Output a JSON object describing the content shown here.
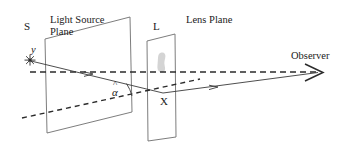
{
  "figure": {
    "background_color": "#ffffff",
    "line_color": "#3a3a3a",
    "blob_color": "#cccccc",
    "labels": {
      "source_plane_marker": "S",
      "source_plane_name_line1": "Light Source",
      "source_plane_name_line2": "Plane",
      "lens_plane_marker": "L",
      "lens_plane_name": "Lens Plane",
      "source_height": "y",
      "lens_point": "X",
      "observer": "Observer",
      "angle_hat": "^",
      "angle_symbol": "α"
    },
    "icons": {
      "light_source": "star-burst-icon",
      "observer_arrow": "arrowhead-right-icon",
      "lens_aperture": "lens-blob-icon"
    },
    "geometry": {
      "source_plane_quad": "45,39 130,17 132,112 47,133",
      "lens_plane_quad": "147,41 175,34 176,137 148,141",
      "light_source_point": [
        30,
        60
      ],
      "lens_intersection_point_X": [
        163,
        93
      ],
      "observer_point": [
        320,
        73
      ],
      "axis_dashed_line": "30,72 318,72",
      "incident_ray": "31,61 163,93",
      "emergent_ray": "163,93 318,73",
      "lower_dashed_line": "22,118 200,79",
      "angle_arc_center": [
        163,
        93
      ],
      "angle_value_label": "α"
    }
  }
}
